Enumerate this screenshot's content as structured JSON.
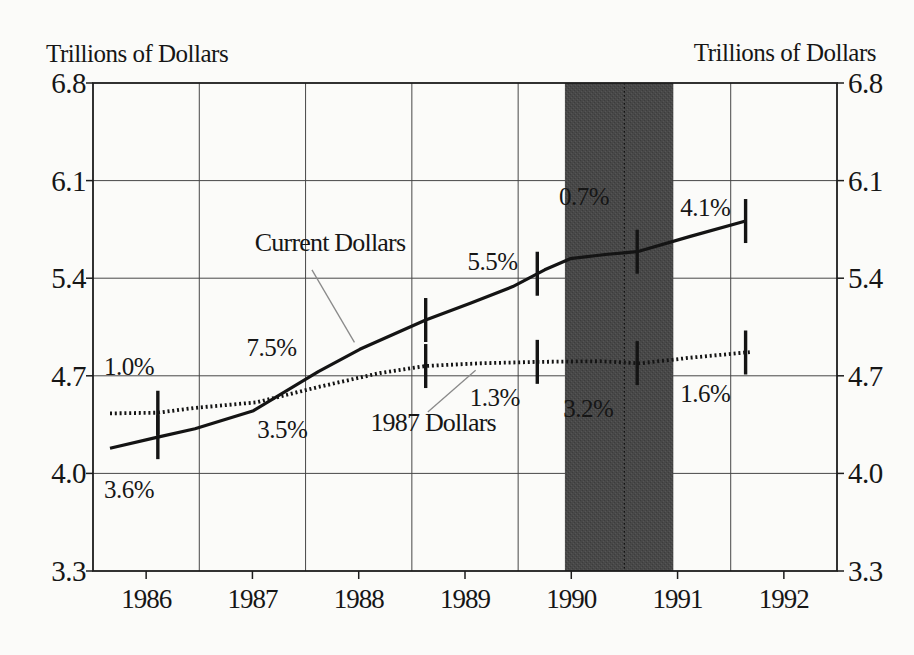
{
  "page": {
    "background_color": "#fbfbf9",
    "text_color": "#161616"
  },
  "chart_data": {
    "type": "line",
    "title": "",
    "ylabel_left": "Trillions of Dollars",
    "ylabel_right": "Trillions of Dollars",
    "x_range": [
      1986,
      1993
    ],
    "y_range": [
      3.3,
      6.8
    ],
    "y_ticks": [
      6.8,
      6.1,
      5.4,
      4.7,
      4.0,
      3.3
    ],
    "x_gridline_years": [
      1987,
      1988,
      1989,
      1990,
      1991,
      1992
    ],
    "x_tick_labels": [
      "1986",
      "1987",
      "1988",
      "1989",
      "1990",
      "1991",
      "1992"
    ],
    "x_tick_centers": [
      1986.5,
      1987.5,
      1988.5,
      1989.5,
      1990.5,
      1991.5,
      1992.5
    ],
    "grid": true,
    "legend_position": "inline-labels",
    "recession_band": {
      "x0": 1990.44,
      "x1": 1991.46,
      "color": "#484848",
      "divider_year": 1991.0
    },
    "series": [
      {
        "name": "Current Dollars",
        "style": "solid",
        "color": "#141414",
        "points": [
          [
            1986.16,
            4.18
          ],
          [
            1986.61,
            4.26
          ],
          [
            1986.96,
            4.32
          ],
          [
            1987.51,
            4.45
          ],
          [
            1988.12,
            4.73
          ],
          [
            1988.51,
            4.89
          ],
          [
            1989.13,
            5.1
          ],
          [
            1989.55,
            5.22
          ],
          [
            1989.95,
            5.34
          ],
          [
            1990.25,
            5.46
          ],
          [
            1990.49,
            5.54
          ],
          [
            1990.82,
            5.57
          ],
          [
            1991.12,
            5.59
          ],
          [
            1991.62,
            5.7
          ],
          [
            1992.14,
            5.81
          ]
        ]
      },
      {
        "name": "1987 Dollars",
        "style": "dotted",
        "color": "#141414",
        "points": [
          [
            1986.16,
            4.43
          ],
          [
            1986.61,
            4.435
          ],
          [
            1986.96,
            4.47
          ],
          [
            1987.54,
            4.51
          ],
          [
            1988.12,
            4.62
          ],
          [
            1988.7,
            4.72
          ],
          [
            1989.13,
            4.77
          ],
          [
            1989.64,
            4.79
          ],
          [
            1990.18,
            4.8
          ],
          [
            1990.77,
            4.805
          ],
          [
            1991.15,
            4.79
          ],
          [
            1991.62,
            4.83
          ],
          [
            1992.18,
            4.87
          ]
        ]
      }
    ],
    "quarter_markers_x": [
      1986.61,
      1989.13,
      1990.18,
      1991.12,
      1992.14
    ],
    "growth_annotations": [
      {
        "text": "3.6%",
        "x": 1986.34,
        "y": 3.89,
        "series": "Current Dollars"
      },
      {
        "text": "1.0%",
        "x": 1986.34,
        "y": 4.77,
        "series": "1987 Dollars"
      },
      {
        "text": "7.5%",
        "x": 1987.68,
        "y": 4.91,
        "series": "Current Dollars"
      },
      {
        "text": "3.5%",
        "x": 1987.78,
        "y": 4.32,
        "series": "1987 Dollars"
      },
      {
        "text": "5.5%",
        "x": 1989.76,
        "y": 5.52,
        "series": "Current Dollars"
      },
      {
        "text": "1.3%",
        "x": 1989.78,
        "y": 4.55,
        "series": "1987 Dollars"
      },
      {
        "text": "0.7%",
        "x": 1990.62,
        "y": 5.99,
        "series": "Current Dollars"
      },
      {
        "text": "3.2%",
        "x": 1990.66,
        "y": 4.47,
        "series": "1987 Dollars"
      },
      {
        "text": "4.1%",
        "x": 1991.76,
        "y": 5.91,
        "series": "Current Dollars"
      },
      {
        "text": "1.6%",
        "x": 1991.76,
        "y": 4.58,
        "series": "1987 Dollars"
      }
    ],
    "series_labels": [
      {
        "text": "Current Dollars",
        "x": 1988.23,
        "y": 5.66,
        "leader": [
          [
            1988.06,
            5.46
          ],
          [
            1988.46,
            4.94
          ]
        ]
      },
      {
        "text": "1987 Dollars",
        "x": 1989.2,
        "y": 4.37,
        "leader": [
          [
            1989.15,
            4.44
          ],
          [
            1989.6,
            4.74
          ]
        ]
      }
    ]
  }
}
